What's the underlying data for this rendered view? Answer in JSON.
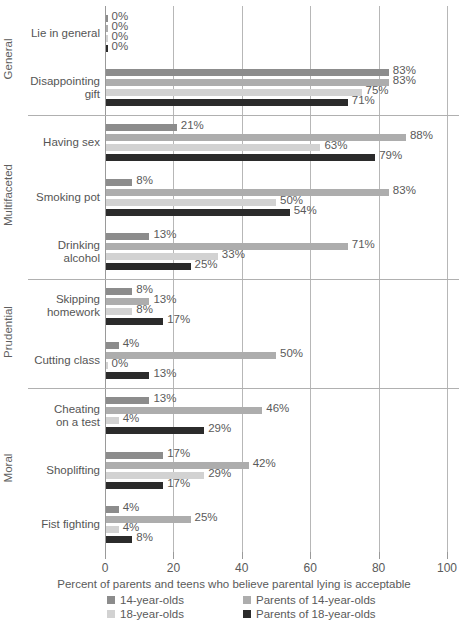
{
  "chart_data": {
    "type": "bar",
    "orientation": "horizontal",
    "title": "",
    "xlabel": "Percent of parents and teens who believe parental lying is acceptable",
    "ylabel": "",
    "xlim": [
      0,
      100
    ],
    "xticks": [
      "0",
      "20",
      "40",
      "60",
      "80",
      "100"
    ],
    "grid": true,
    "legend_position": "bottom",
    "series": [
      {
        "name": "14-year-olds",
        "color": "#8c8c8c",
        "values": [
          0,
          83,
          21,
          8,
          13,
          8,
          4,
          13,
          17,
          4
        ]
      },
      {
        "name": "Parents of 14-year-olds",
        "color": "#adadad",
        "values": [
          0,
          83,
          88,
          83,
          71,
          13,
          50,
          46,
          42,
          25
        ]
      },
      {
        "name": "18-year-olds",
        "color": "#d2d2d2",
        "values": [
          0,
          75,
          63,
          50,
          33,
          8,
          0,
          4,
          29,
          4
        ]
      },
      {
        "name": "Parents of 18-year-olds",
        "color": "#2b2b2b",
        "values": [
          0,
          71,
          79,
          54,
          25,
          17,
          13,
          29,
          17,
          8
        ]
      }
    ],
    "categories": [
      "Lie in general",
      "Disappointing\ngift",
      "Having sex",
      "Smoking pot",
      "Drinking\nalcohol",
      "Skipping\nhomework",
      "Cutting class",
      "Cheating\non a test",
      "Shoplifting",
      "Fist fighting"
    ],
    "value_labels": [
      [
        "0%",
        "0%",
        "0%",
        "0%"
      ],
      [
        "83%",
        "83%",
        "75%",
        "71%"
      ],
      [
        "21%",
        "88%",
        "63%",
        "79%"
      ],
      [
        "8%",
        "83%",
        "50%",
        "54%"
      ],
      [
        "13%",
        "71%",
        "33%",
        "25%"
      ],
      [
        "8%",
        "13%",
        "8%",
        "17%"
      ],
      [
        "4%",
        "50%",
        "0%",
        "13%"
      ],
      [
        "13%",
        "46%",
        "4%",
        "29%"
      ],
      [
        "17%",
        "42%",
        "29%",
        "17%"
      ],
      [
        "4%",
        "25%",
        "4%",
        "8%"
      ]
    ],
    "sections": [
      {
        "label": "General",
        "categories": [
          "Lie in general",
          "Disappointing\ngift"
        ]
      },
      {
        "label": "Multifaceted",
        "categories": [
          "Having sex",
          "Smoking pot",
          "Drinking\nalcohol"
        ]
      },
      {
        "label": "Prudential",
        "categories": [
          "Skipping\nhomework",
          "Cutting class"
        ]
      },
      {
        "label": "Moral",
        "categories": [
          "Cheating\non a test",
          "Shoplifting",
          "Fist fighting"
        ]
      }
    ]
  },
  "legend": {
    "items": [
      {
        "label": "14-year-olds",
        "color": "#8c8c8c"
      },
      {
        "label": "Parents of 14-year-olds",
        "color": "#adadad"
      },
      {
        "label": "18-year-olds",
        "color": "#d2d2d2"
      },
      {
        "label": "Parents of 18-year-olds",
        "color": "#2b2b2b"
      }
    ]
  }
}
